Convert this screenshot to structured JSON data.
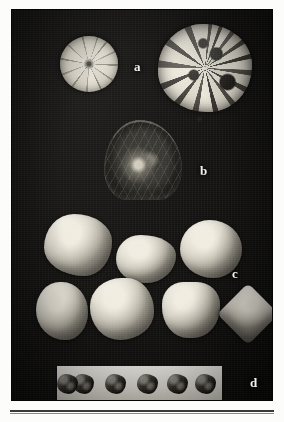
{
  "figure": {
    "plate_background_color": "#121110",
    "page_background_color": "#fbfbf9",
    "label_color": "#f2f0e8",
    "panels": [
      {
        "letter": "a",
        "name": "panel-a",
        "description": "two circular cross-sections of fruit / seed bodies",
        "specimen_count": 2
      },
      {
        "letter": "b",
        "name": "panel-b",
        "description": "single dark translucent drop-shaped stone with internal inclusion",
        "specimen_count": 1
      },
      {
        "letter": "c",
        "name": "panel-c",
        "description": "seven angular pale seed-stones arranged in two rows",
        "specimen_count": 7
      },
      {
        "letter": "d",
        "name": "panel-d",
        "description": "five small dark granules on a white card strip",
        "specimen_count": 5
      }
    ]
  },
  "caption": {
    "text": ""
  }
}
